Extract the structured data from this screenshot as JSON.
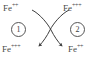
{
  "diagram": {
    "background_color": "#ffffff",
    "stroke_color": "#3d3d3d",
    "text_color": "#4a4a4a",
    "labels": {
      "top_left": {
        "element": "Fe",
        "charge": "++",
        "full": "Fe++"
      },
      "top_right": {
        "element": "Fe",
        "charge": "+++",
        "full": "Fe+++"
      },
      "bottom_left": {
        "element": "Fe",
        "charge": "+++",
        "full": "Fe+++"
      },
      "bottom_right": {
        "element": "Fe",
        "charge": "++",
        "full": "Fe++"
      }
    },
    "steps": [
      {
        "number": "1",
        "name": "oxidation-step"
      },
      {
        "number": "2",
        "name": "reduction-step"
      }
    ],
    "arrows": [
      {
        "name": "arrow-left-to-right",
        "from": "top_left",
        "to": "bottom_right",
        "style": "curved",
        "arrowhead": "end"
      },
      {
        "name": "arrow-right-to-left",
        "from": "top_right",
        "to": "bottom_left",
        "style": "curved",
        "arrowhead": "end"
      }
    ]
  }
}
